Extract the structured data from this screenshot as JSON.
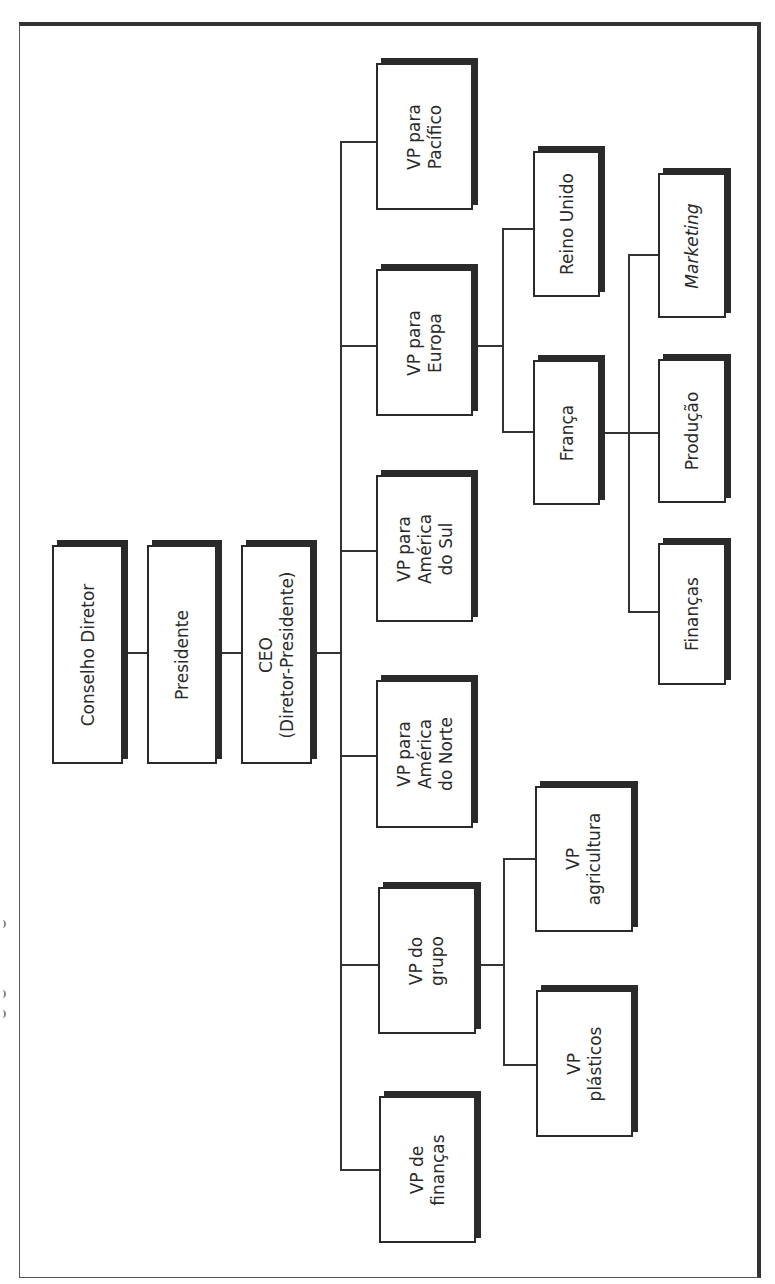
{
  "diagram": {
    "type": "org-chart",
    "orientation": "rotated-90-ccw",
    "colors": {
      "line": "#333333",
      "box_border": "#2a2a2a",
      "shadow": "#2a2a2a",
      "background": "#ffffff"
    },
    "nodes": {
      "board": "Conselho Diretor",
      "president": "Presidente",
      "ceo": "CEO\n(Diretor-Presidente)",
      "vp_pacific": "VP para\nPacífico",
      "vp_europe": "VP para\nEuropa",
      "vp_south_america": "VP para\nAmérica\ndo Sul",
      "vp_north_america": "VP para\nAmérica\ndo Norte",
      "vp_group": "VP do\ngrupo",
      "vp_finance": "VP de\nfinanças",
      "uk": "Reino Unido",
      "france": "França",
      "marketing": "Marketing",
      "production": "Produção",
      "finance_fr": "Finanças",
      "vp_agriculture": "VP\nagricultura",
      "vp_plastics": "VP\nplásticos"
    },
    "edges": [
      [
        "board",
        "president"
      ],
      [
        "president",
        "ceo"
      ],
      [
        "ceo",
        "vp_pacific"
      ],
      [
        "ceo",
        "vp_europe"
      ],
      [
        "ceo",
        "vp_south_america"
      ],
      [
        "ceo",
        "vp_north_america"
      ],
      [
        "ceo",
        "vp_group"
      ],
      [
        "ceo",
        "vp_finance"
      ],
      [
        "vp_europe",
        "uk"
      ],
      [
        "vp_europe",
        "france"
      ],
      [
        "france",
        "marketing"
      ],
      [
        "france",
        "production"
      ],
      [
        "france",
        "finance_fr"
      ],
      [
        "vp_group",
        "vp_agriculture"
      ],
      [
        "vp_group",
        "vp_plastics"
      ]
    ]
  }
}
